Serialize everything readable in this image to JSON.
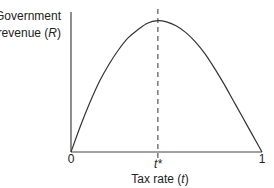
{
  "chart_data": {
    "type": "line",
    "title": "",
    "ylabel_line1": "Government",
    "ylabel_line2_prefix": "revenue (",
    "ylabel_var": "R",
    "ylabel_line2_suffix": ")",
    "xlabel_prefix": "Tax rate (",
    "xlabel_var": "t",
    "xlabel_suffix": ")",
    "xlim": [
      0,
      1
    ],
    "ylim": [
      0,
      1.05
    ],
    "x_ticks": [
      {
        "value": 0,
        "label": "0"
      },
      {
        "value": 0.455,
        "label": "t*"
      },
      {
        "value": 1,
        "label": "1"
      }
    ],
    "optimum_x": 0.455,
    "optimum_label": "t*",
    "series": [
      {
        "name": "Laffer curve",
        "x": [
          0,
          0.05,
          0.1,
          0.15,
          0.2,
          0.25,
          0.3,
          0.35,
          0.4,
          0.455,
          0.5,
          0.55,
          0.6,
          0.65,
          0.7,
          0.75,
          0.8,
          0.85,
          0.9,
          0.95,
          1
        ],
        "y": [
          0,
          0.2,
          0.38,
          0.54,
          0.67,
          0.78,
          0.87,
          0.93,
          0.98,
          1.0,
          0.99,
          0.96,
          0.91,
          0.84,
          0.75,
          0.64,
          0.52,
          0.39,
          0.26,
          0.13,
          0
        ]
      }
    ],
    "grid": false,
    "legend": "none"
  }
}
